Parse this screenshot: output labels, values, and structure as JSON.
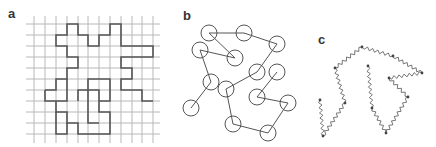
{
  "figure": {
    "panels": [
      {
        "label": "a",
        "description": "lattice self-avoiding walk",
        "label_pos": [
          8,
          18
        ],
        "grid": {
          "x_lines": [
            34,
            45,
            56,
            67,
            78,
            88,
            99,
            110,
            121,
            132,
            142,
            153
          ],
          "y_lines": [
            24,
            35,
            46,
            57,
            68,
            79,
            90,
            101,
            112,
            123,
            134
          ],
          "x_extent": [
            26,
            160
          ],
          "y_extent": [
            16,
            143
          ],
          "line_color": "#b8b8b8"
        },
        "path_color": "#555555",
        "path": [
          [
            45,
            90
          ],
          [
            56,
            90
          ],
          [
            56,
            79
          ],
          [
            67,
            79
          ],
          [
            67,
            68
          ],
          [
            78,
            68
          ],
          [
            78,
            57
          ],
          [
            67,
            57
          ],
          [
            67,
            46
          ],
          [
            56,
            46
          ],
          [
            56,
            35
          ],
          [
            67,
            35
          ],
          [
            67,
            24
          ],
          [
            78,
            24
          ],
          [
            78,
            35
          ],
          [
            88,
            35
          ],
          [
            88,
            46
          ],
          [
            99,
            46
          ],
          [
            99,
            35
          ],
          [
            110,
            35
          ],
          [
            110,
            24
          ],
          [
            121,
            24
          ],
          [
            121,
            46
          ],
          [
            153,
            46
          ],
          [
            153,
            57
          ],
          [
            121,
            57
          ],
          [
            121,
            68
          ],
          [
            132,
            68
          ],
          [
            132,
            79
          ],
          [
            121,
            79
          ],
          [
            121,
            90
          ],
          [
            142,
            90
          ],
          [
            142,
            101
          ],
          [
            153,
            101
          ]
        ],
        "path2": [
          [
            45,
            90
          ],
          [
            45,
            101
          ],
          [
            67,
            101
          ],
          [
            67,
            79
          ]
        ],
        "path3": [
          [
            56,
            101
          ],
          [
            56,
            112
          ],
          [
            67,
            112
          ],
          [
            67,
            123
          ],
          [
            78,
            123
          ],
          [
            78,
            134
          ],
          [
            110,
            134
          ],
          [
            110,
            112
          ],
          [
            99,
            112
          ],
          [
            99,
            90
          ],
          [
            88,
            90
          ],
          [
            88,
            79
          ],
          [
            110,
            79
          ],
          [
            110,
            101
          ],
          [
            99,
            101
          ]
        ],
        "path4": [
          [
            56,
            112
          ],
          [
            56,
            134
          ],
          [
            67,
            134
          ],
          [
            67,
            123
          ]
        ],
        "path5": [
          [
            78,
            101
          ],
          [
            78,
            90
          ],
          [
            88,
            90
          ],
          [
            88,
            123
          ],
          [
            99,
            123
          ]
        ]
      },
      {
        "label": "b",
        "description": "freely-jointed bead chain",
        "label_pos": [
          183,
          20
        ],
        "bead_radius": 8,
        "bead_color": "#555555",
        "beads": [
          [
            191,
            108
          ],
          [
            211,
            82
          ],
          [
            200,
            50
          ],
          [
            235,
            58
          ],
          [
            209,
            33
          ],
          [
            244,
            33
          ],
          [
            277,
            44
          ],
          [
            257,
            72
          ],
          [
            226,
            89
          ],
          [
            233,
            124
          ],
          [
            268,
            133
          ],
          [
            288,
            103
          ],
          [
            257,
            97
          ],
          [
            277,
            72
          ]
        ],
        "bonds": [
          [
            0,
            1
          ],
          [
            1,
            2
          ],
          [
            2,
            3
          ],
          [
            4,
            3
          ],
          [
            4,
            5
          ],
          [
            5,
            6
          ],
          [
            6,
            7
          ],
          [
            7,
            8
          ],
          [
            8,
            9
          ],
          [
            9,
            10
          ],
          [
            10,
            11
          ],
          [
            11,
            12
          ],
          [
            12,
            13
          ]
        ]
      },
      {
        "label": "c",
        "description": "bead-spring chain",
        "label_pos": [
          318,
          44
        ],
        "spring_color": "#555555",
        "beads": [
          [
            320,
            100
          ],
          [
            323,
            136
          ],
          [
            345,
            103
          ],
          [
            335,
            68
          ],
          [
            362,
            47
          ],
          [
            393,
            56
          ],
          [
            422,
            73
          ],
          [
            389,
            78
          ],
          [
            408,
            97
          ],
          [
            386,
            133
          ],
          [
            372,
            108
          ],
          [
            368,
            66
          ]
        ]
      }
    ]
  }
}
